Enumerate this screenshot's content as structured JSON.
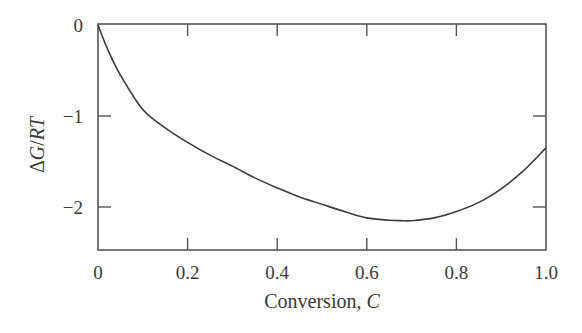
{
  "chart_data": {
    "type": "line",
    "title": "",
    "xlabel": "Conversion, C",
    "xlabel_parts": {
      "text": "Conversion, ",
      "italic": "C"
    },
    "ylabel": "ΔG/RT",
    "ylabel_parts": {
      "delta": "Δ",
      "italic1": "G",
      "slash": "/",
      "italic2": "RT"
    },
    "xlim": [
      0,
      1.0
    ],
    "ylim": [
      -2.47,
      0.0
    ],
    "xticks": [
      0,
      0.2,
      0.4,
      0.6,
      0.8,
      1.0
    ],
    "xtick_labels": [
      "0",
      "0.2",
      "0.4",
      "0.6",
      "0.8",
      "1.0"
    ],
    "yticks": [
      0,
      -1,
      -2
    ],
    "ytick_labels": [
      "0",
      "−1",
      "−2"
    ],
    "grid": false,
    "legend": null,
    "series": [
      {
        "name": "ΔG/RT",
        "x": [
          0.0,
          0.02,
          0.05,
          0.1,
          0.15,
          0.2,
          0.25,
          0.3,
          0.35,
          0.4,
          0.45,
          0.5,
          0.55,
          0.6,
          0.65,
          0.68,
          0.7,
          0.75,
          0.8,
          0.85,
          0.9,
          0.95,
          1.0
        ],
        "y": [
          0.0,
          -0.25,
          -0.55,
          -0.93,
          -1.13,
          -1.29,
          -1.43,
          -1.55,
          -1.68,
          -1.79,
          -1.89,
          -1.97,
          -2.05,
          -2.12,
          -2.145,
          -2.15,
          -2.15,
          -2.12,
          -2.05,
          -1.95,
          -1.8,
          -1.6,
          -1.35
        ]
      }
    ]
  }
}
